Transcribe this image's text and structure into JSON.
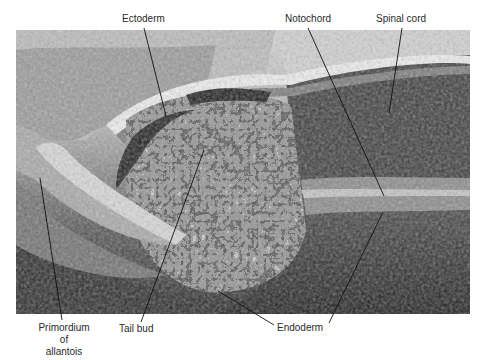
{
  "figure": {
    "type": "scanning electron micrograph",
    "labels": [
      {
        "id": "ectoderm",
        "text": "Ectoderm"
      },
      {
        "id": "notochord",
        "text": "Notochord"
      },
      {
        "id": "spinal-cord",
        "text": "Spinal cord"
      },
      {
        "id": "primordium",
        "lines": [
          "Primordium",
          "of",
          "allantois"
        ]
      },
      {
        "id": "tail-bud",
        "text": "Tail bud"
      },
      {
        "id": "endoderm",
        "text": "Endoderm"
      }
    ]
  },
  "colors": {
    "background": "#ffffff",
    "label_text": "#2a2a2a",
    "leader_line": "#111111"
  }
}
